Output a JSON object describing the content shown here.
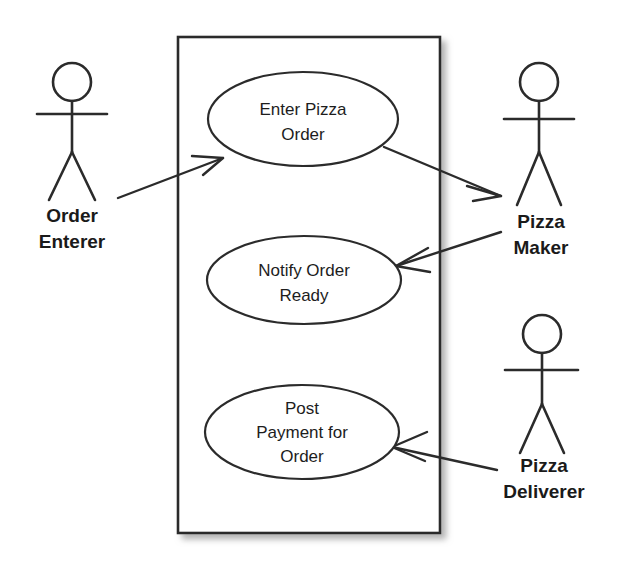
{
  "diagram": {
    "type": "uml-use-case-diagram",
    "background_color": "#ffffff",
    "line_color": "#2b2b2b",
    "shadow_color": "#bdbdbd",
    "system_boundary": {
      "name": "system-boundary",
      "label": "",
      "x": 178,
      "y": 37,
      "width": 262,
      "height": 496
    },
    "use_cases": [
      {
        "id": "enter-pizza-order",
        "lines": [
          "Enter Pizza",
          "Order"
        ],
        "cx": 303,
        "cy": 119,
        "rx": 95,
        "ry": 47
      },
      {
        "id": "notify-order-ready",
        "lines": [
          "Notify Order",
          "Ready"
        ],
        "cx": 304,
        "cy": 280,
        "rx": 97,
        "ry": 44
      },
      {
        "id": "post-payment-for-order",
        "lines": [
          "Post",
          "Payment for",
          "Order"
        ],
        "cx": 302,
        "cy": 432,
        "rx": 97,
        "ry": 47
      }
    ],
    "actors": [
      {
        "id": "order-enterer",
        "lines": [
          "Order",
          "Enterer"
        ],
        "cx": 72,
        "head_cy": 82,
        "label_y": 222
      },
      {
        "id": "pizza-maker",
        "lines": [
          "Pizza",
          "Maker"
        ],
        "cx": 539,
        "head_cy": 82,
        "label_y": 228
      },
      {
        "id": "pizza-deliverer",
        "lines": [
          "Pizza",
          "Deliverer"
        ],
        "cx": 542,
        "head_cy": 334,
        "label_y": 472
      }
    ],
    "associations": [
      {
        "id": "order-enterer-to-enter-pizza-order",
        "from": "order-enterer",
        "to": "enter-pizza-order",
        "direction": "to-use-case"
      },
      {
        "id": "enter-pizza-order-to-pizza-maker",
        "from": "enter-pizza-order",
        "to": "pizza-maker",
        "direction": "to-actor"
      },
      {
        "id": "pizza-maker-to-notify-order-ready",
        "from": "pizza-maker",
        "to": "notify-order-ready",
        "direction": "to-use-case"
      },
      {
        "id": "pizza-deliverer-to-post-payment",
        "from": "pizza-deliverer",
        "to": "post-payment-for-order",
        "direction": "to-use-case"
      }
    ]
  }
}
